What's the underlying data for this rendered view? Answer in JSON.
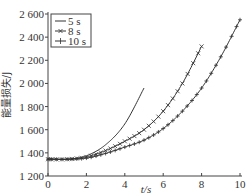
{
  "chart_data": {
    "type": "line",
    "title": "",
    "xlabel": "t/s",
    "ylabel": "能量损失/J",
    "xlim": [
      0,
      10
    ],
    "ylim": [
      1200,
      2600
    ],
    "xticks": [
      "0",
      "2",
      "4",
      "6",
      "8",
      "10"
    ],
    "yticks": [
      "1 200",
      "1 400",
      "1 600",
      "1 800",
      "2 000",
      "2 200",
      "2 400",
      "2 600"
    ],
    "grid": false,
    "legend_position": "upper left",
    "series": [
      {
        "name": "5 s",
        "marker": "none",
        "x": [
          0,
          1,
          2,
          3,
          4,
          5
        ],
        "values": [
          1350,
          1345,
          1375,
          1470,
          1650,
          1960
        ]
      },
      {
        "name": "8 s",
        "marker": "x",
        "x": [
          0,
          1,
          2,
          3,
          4,
          5,
          6,
          7,
          8
        ],
        "values": [
          1345,
          1345,
          1365,
          1420,
          1500,
          1600,
          1760,
          2000,
          2320
        ]
      },
      {
        "name": "10 s",
        "marker": "+",
        "x": [
          0,
          1,
          2,
          3,
          4,
          5,
          6,
          7,
          8,
          9,
          10
        ],
        "values": [
          1345,
          1345,
          1355,
          1395,
          1450,
          1510,
          1610,
          1760,
          1960,
          2230,
          2550
        ]
      }
    ]
  }
}
